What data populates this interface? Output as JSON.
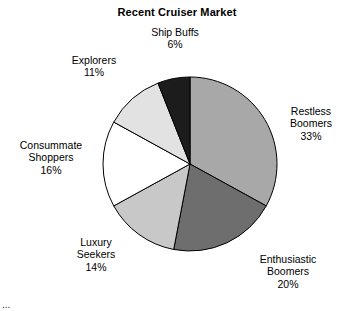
{
  "chart_data": {
    "type": "pie",
    "title": "Recent Cruiser Market",
    "xlabel": "",
    "ylabel": "",
    "legend_position": "none",
    "grid": false,
    "start_angle_deg": 0,
    "direction": "clockwise",
    "categories": [
      "Restless Boomers",
      "Enthusiastic Boomers",
      "Luxury Seekers",
      "Consummate Shoppers",
      "Explorers",
      "Ship Buffs"
    ],
    "values": [
      33,
      20,
      14,
      16,
      11,
      6
    ],
    "value_labels": [
      "33%",
      "20%",
      "14%",
      "16%",
      "11%",
      "6%"
    ],
    "colors": [
      "#a8a8a8",
      "#6e6e6e",
      "#c8c8c8",
      "#ffffff",
      "#e2e2e2",
      "#1c1c1c"
    ],
    "slices": [
      {
        "name": "Restless Boomers",
        "name_line1": "Restless",
        "name_line2": "Boomers",
        "value": 33,
        "value_label": "33%",
        "color": "#a8a8a8"
      },
      {
        "name": "Enthusiastic Boomers",
        "name_line1": "Enthusiastic",
        "name_line2": "Boomers",
        "value": 20,
        "value_label": "20%",
        "color": "#6e6e6e"
      },
      {
        "name": "Luxury Seekers",
        "name_line1": "Luxury",
        "name_line2": "Seekers",
        "value": 14,
        "value_label": "14%",
        "color": "#c8c8c8"
      },
      {
        "name": "Consummate Shoppers",
        "name_line1": "Consummate",
        "name_line2": "Shoppers",
        "value": 16,
        "value_label": "16%",
        "color": "#ffffff"
      },
      {
        "name": "Explorers",
        "name_line1": "Explorers",
        "name_line2": "",
        "value": 11,
        "value_label": "11%",
        "color": "#e2e2e2"
      },
      {
        "name": "Ship Buffs",
        "name_line1": "Ship Buffs",
        "name_line2": "",
        "value": 6,
        "value_label": "6%",
        "color": "#1c1c1c"
      }
    ],
    "outline_color": "#000000"
  },
  "footer": {
    "cropped_text": "..."
  }
}
